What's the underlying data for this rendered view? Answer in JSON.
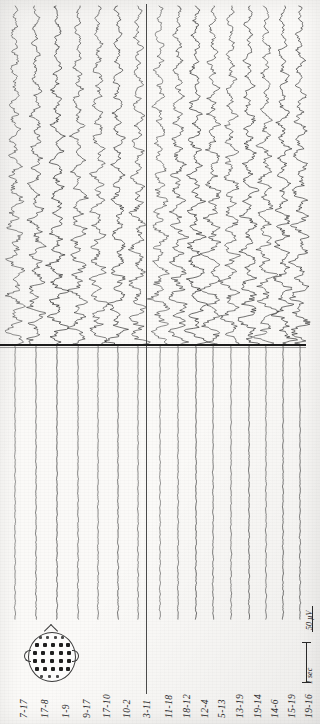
{
  "document": {
    "kind": "scanned-eeg-chart",
    "orientation": "rotated-90",
    "title": "EEG Recording"
  },
  "channels": {
    "left_chain_label": "left-montage-chain",
    "right_chain_label": "right-montage-chain",
    "left": [
      {
        "label": "7-17"
      },
      {
        "label": "17-8"
      },
      {
        "label": "1-9"
      },
      {
        "label": "9-17"
      },
      {
        "label": "17-10"
      },
      {
        "label": "10-2"
      },
      {
        "label": "3-11"
      }
    ],
    "right": [
      {
        "label": "11-18"
      },
      {
        "label": "18-12"
      },
      {
        "label": "12-4"
      },
      {
        "label": "5-13"
      },
      {
        "label": "13-19"
      },
      {
        "label": "19-14"
      },
      {
        "label": "14-6"
      },
      {
        "label": "15-19"
      },
      {
        "label": "19-16"
      }
    ]
  },
  "scale": {
    "time_label": "1 sec",
    "amplitude_label": "50 µV"
  },
  "annotations": {
    "margin_note": "",
    "event_line_name": "seizure-offset-line"
  },
  "montage_diagram": {
    "name": "head-electrode-montage",
    "caption": ""
  },
  "chart_data": {
    "type": "line",
    "xlabel": "Time",
    "ylabel": "Amplitude",
    "grid": false,
    "legend": "none",
    "time_axis_direction": "top-to-bottom (page rotated 90°)",
    "duration_marker_sec": 1,
    "amplitude_marker_uv": 50,
    "event_markers": [
      {
        "name": "seizure-offset-line",
        "position_fraction": 0.476,
        "style": "heavy-horizontal-rule"
      }
    ],
    "channel_count": 16,
    "groups": [
      {
        "name": "left",
        "channels": [
          "7-17",
          "17-8",
          "1-9",
          "9-17",
          "17-10",
          "10-2",
          "3-11"
        ]
      },
      {
        "name": "right",
        "channels": [
          "11-18",
          "18-12",
          "12-4",
          "5-13",
          "13-19",
          "19-14",
          "14-6",
          "15-19",
          "19-16"
        ]
      }
    ],
    "segments": [
      {
        "name": "ictal",
        "range_fraction": [
          0.0,
          0.476
        ],
        "relative_amplitude": 1.0,
        "dominant_freq_hz": 9
      },
      {
        "name": "postictal-suppression",
        "range_fraction": [
          0.476,
          1.0
        ],
        "relative_amplitude": 0.22,
        "dominant_freq_hz": 16
      }
    ]
  }
}
